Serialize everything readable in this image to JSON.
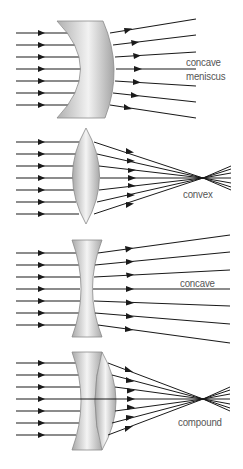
{
  "diagram": {
    "title": "",
    "panels": [
      {
        "id": "concave-meniscus",
        "label_lines": [
          "concave",
          "meniscus"
        ],
        "behavior": "diverging"
      },
      {
        "id": "convex",
        "label_lines": [
          "convex"
        ],
        "behavior": "converging"
      },
      {
        "id": "concave",
        "label_lines": [
          "concave"
        ],
        "behavior": "diverging"
      },
      {
        "id": "compound",
        "label_lines": [
          "compound"
        ],
        "behavior": "converging"
      }
    ],
    "colors": {
      "ray": "#1a1a1a",
      "lens_fill_edge": "#a8a8a8",
      "lens_fill_center": "#f2f2f2",
      "lens_stroke": "#8a8a8a",
      "label": "#555555",
      "background": "#ffffff"
    },
    "rays_per_panel": 7
  }
}
